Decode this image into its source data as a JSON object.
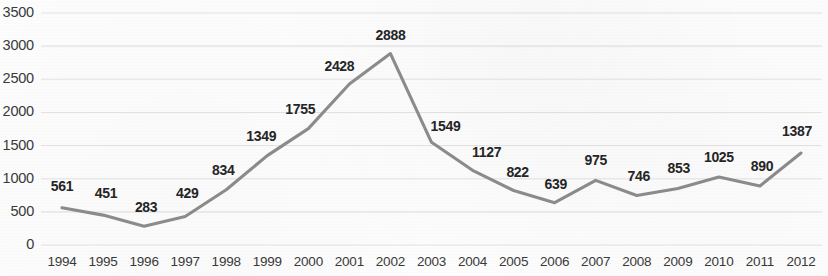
{
  "chart_data": {
    "type": "line",
    "title": "",
    "subtitle": "",
    "xlabel": "",
    "ylabel": "",
    "categories": [
      "1994",
      "1995",
      "1996",
      "1997",
      "1998",
      "1999",
      "2000",
      "2001",
      "2002",
      "2003",
      "2004",
      "2005",
      "2006",
      "2007",
      "2008",
      "2009",
      "2010",
      "2011",
      "2012"
    ],
    "values": [
      561,
      451,
      283,
      429,
      834,
      1349,
      1755,
      2428,
      2888,
      1549,
      1127,
      822,
      639,
      975,
      746,
      853,
      1025,
      890,
      1387
    ],
    "series": [
      {
        "name": "",
        "values": [
          561,
          451,
          283,
          429,
          834,
          1349,
          1755,
          2428,
          2888,
          1549,
          1127,
          822,
          639,
          975,
          746,
          853,
          1025,
          890,
          1387
        ]
      }
    ],
    "data_labels": [
      "561",
      "451",
      "283",
      "429",
      "834",
      "1349",
      "1755",
      "2428",
      "2888",
      "1549",
      "1127",
      "822",
      "639",
      "975",
      "746",
      "853",
      "1025",
      "890",
      "1387"
    ],
    "ylim": [
      0,
      3500
    ],
    "yticks": [
      0,
      500,
      1000,
      1500,
      2000,
      2500,
      3000,
      3500
    ],
    "ytick_labels": [
      "0",
      "500",
      "1000",
      "1500",
      "2000",
      "2500",
      "3000",
      "3500"
    ],
    "grid": true,
    "grid_axis": "y",
    "legend": false,
    "legend_position": "none",
    "line_color": "#8d8d8d",
    "grid_color": "#e3e3e3",
    "label_color": "#262626",
    "tick_color": "#3a3a3a",
    "background_color": "#fdfdfd"
  },
  "label_offsets": [
    {
      "dx": 0,
      "dy": -30
    },
    {
      "dx": 3,
      "dy": -30
    },
    {
      "dx": 2,
      "dy": -27
    },
    {
      "dx": 2,
      "dy": -32
    },
    {
      "dx": -3,
      "dy": -28
    },
    {
      "dx": -6,
      "dy": -28
    },
    {
      "dx": -8,
      "dy": -28
    },
    {
      "dx": -10,
      "dy": -26
    },
    {
      "dx": 0,
      "dy": -27
    },
    {
      "dx": 14,
      "dy": -24
    },
    {
      "dx": 14,
      "dy": -26
    },
    {
      "dx": 4,
      "dy": -27
    },
    {
      "dx": 1,
      "dy": -27
    },
    {
      "dx": 0,
      "dy": -28
    },
    {
      "dx": 2,
      "dy": -28
    },
    {
      "dx": 1,
      "dy": -28
    },
    {
      "dx": 0,
      "dy": -28
    },
    {
      "dx": 2,
      "dy": -28
    },
    {
      "dx": -4,
      "dy": -30
    }
  ]
}
